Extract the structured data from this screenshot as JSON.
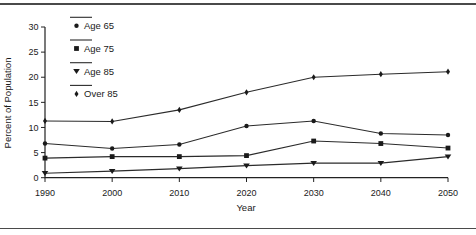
{
  "chart_data": {
    "type": "line",
    "title": "",
    "xlabel": "Year",
    "ylabel": "Percent of Population",
    "x": [
      1990,
      2000,
      2010,
      2020,
      2030,
      2040,
      2050
    ],
    "xticks": [
      "1990",
      "2000",
      "2010",
      "2020",
      "2030",
      "2040",
      "2050"
    ],
    "yticks": [
      0,
      5,
      10,
      15,
      20,
      25,
      30
    ],
    "ylim": [
      0,
      30
    ],
    "xlim": [
      1990,
      2050
    ],
    "grid": false,
    "legend_position": "top-left-inside",
    "line_color": "#2b2b2b",
    "marker_color": "#1a1a1a",
    "series": [
      {
        "name": "Age 65",
        "marker": "circle",
        "values": [
          6.8,
          5.8,
          6.6,
          10.3,
          11.3,
          8.8,
          8.5
        ]
      },
      {
        "name": "Age 75",
        "marker": "square",
        "values": [
          3.9,
          4.2,
          4.2,
          4.4,
          7.3,
          6.8,
          5.9
        ]
      },
      {
        "name": "Age 85",
        "marker": "triangle-down",
        "values": [
          0.9,
          1.3,
          1.8,
          2.4,
          2.9,
          2.9,
          4.2
        ]
      },
      {
        "name": "Over 85",
        "marker": "diamond",
        "values": [
          11.3,
          11.2,
          13.5,
          17.0,
          20.0,
          20.6,
          21.1
        ]
      }
    ]
  }
}
